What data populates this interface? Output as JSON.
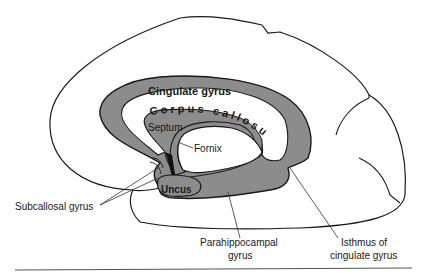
{
  "diagram": {
    "type": "anatomical-illustration",
    "colors": {
      "background": "#ffffff",
      "outline": "#1a1a1a",
      "limbic_fill": "#8c8c8c",
      "white_matter": "#ffffff",
      "rule_line": "#555555"
    },
    "labels": {
      "cingulate_gyrus": "Cingulate gyrus",
      "corpus_callosum": "Corpus callosum",
      "septum": "Septum",
      "fornix": "Fornix",
      "uncus": "Uncus",
      "subcallosal_gyrus": "Subcallosal gyrus",
      "parahippocampal_gyrus_line1": "Parahippocampal",
      "parahippocampal_gyrus_line2": "gyrus",
      "isthmus_line1": "Isthmus of",
      "isthmus_line2": "cingulate gyrus"
    }
  }
}
